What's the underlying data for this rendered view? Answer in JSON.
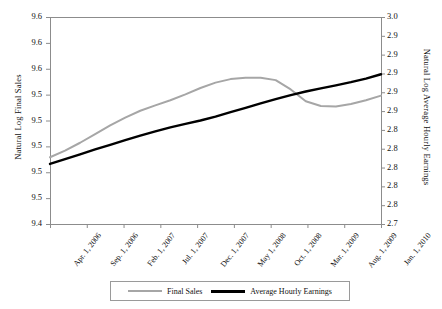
{
  "chart_data": {
    "type": "line",
    "title": "",
    "xlabel": "",
    "ylabel": "Natural Log Final Sales",
    "ylabel_right": "Natural Log Average Hourly Earnings",
    "grid": false,
    "legend_position": "bottom",
    "categories": [
      "Apr. 1, 2006",
      "Sep. 1, 2006",
      "Feb. 1, 2007",
      "Jul. 1, 2007",
      "Dec. 1, 2007",
      "May 1, 2008",
      "Oct. 1, 2008",
      "Mar. 1, 2009",
      "Aug. 1, 2009",
      "Jan. 1, 2010"
    ],
    "ytick_labels_left": [
      "9.6",
      "9.6",
      "9.6",
      "9.5",
      "9.5",
      "9.5",
      "9.5",
      "9.5",
      "9.4"
    ],
    "ytick_labels_right": [
      "3.0",
      "2.9",
      "2.9",
      "2.9",
      "2.9",
      "2.9",
      "2.8",
      "2.8",
      "2.8",
      "2.8",
      "2.8",
      "2.7"
    ],
    "ylim_left": [
      9.44,
      9.64
    ],
    "ylim_right": [
      2.7,
      3.0
    ],
    "series": [
      {
        "name": "Final Sales",
        "axis": "left",
        "color": "#a6a6a6",
        "x": [
          0,
          1,
          2,
          3,
          4,
          5,
          6,
          7,
          8,
          9,
          10,
          11,
          12,
          13,
          14,
          15,
          16,
          17,
          18,
          19,
          20,
          21,
          22
        ],
        "values": [
          9.5045,
          9.5109,
          9.5185,
          9.5268,
          9.5352,
          9.5428,
          9.5494,
          9.5546,
          9.5596,
          9.5652,
          9.5714,
          9.5766,
          9.58,
          9.5812,
          9.5814,
          9.579,
          9.57,
          9.5586,
          9.554,
          9.5536,
          9.556,
          9.5596,
          9.564
        ]
      },
      {
        "name": "Average Hourly Earnings",
        "axis": "right",
        "color": "#000000",
        "x": [
          0,
          1,
          2,
          3,
          4,
          5,
          6,
          7,
          8,
          9,
          10,
          11,
          12,
          13,
          14,
          15,
          16,
          17,
          18,
          19,
          20,
          21,
          22
        ],
        "values": [
          2.787,
          2.794,
          2.801,
          2.808,
          2.8148,
          2.8215,
          2.828,
          2.8342,
          2.84,
          2.8452,
          2.85,
          2.8556,
          2.862,
          2.8684,
          2.8748,
          2.881,
          2.8868,
          2.892,
          2.8966,
          2.901,
          2.9056,
          2.9108,
          2.917
        ]
      }
    ]
  },
  "legend": {
    "items": [
      {
        "label": "Final Sales",
        "style": "gray"
      },
      {
        "label": "Average Hourly Earnings",
        "style": "black"
      }
    ]
  },
  "plot_frame": {
    "left": 50,
    "right": 381,
    "top": 17,
    "bottom": 224,
    "border_color": "#8c8c8c"
  }
}
